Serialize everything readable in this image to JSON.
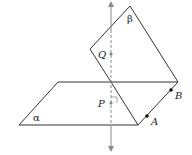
{
  "diagram": {
    "type": "geometry-planes",
    "planes": [
      {
        "name": "alpha",
        "label": "α"
      },
      {
        "name": "beta",
        "label": "β"
      }
    ],
    "points": [
      {
        "name": "Q",
        "label": "Q"
      },
      {
        "name": "P",
        "label": "P"
      },
      {
        "name": "A",
        "label": "A"
      },
      {
        "name": "B",
        "label": "B"
      }
    ],
    "colors": {
      "line": "#333333",
      "axis": "#8a8a8a",
      "point": "#111111",
      "axis_point": "#8a8a8a"
    }
  }
}
